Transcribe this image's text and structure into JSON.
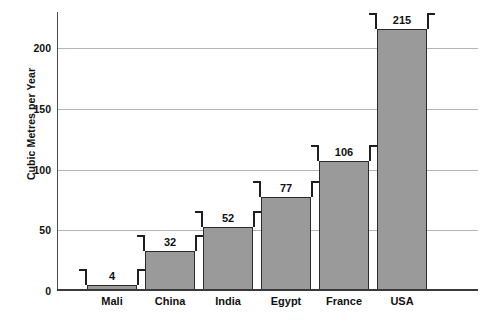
{
  "chart_data": {
    "type": "bar",
    "title": "",
    "xlabel": "",
    "ylabel": "Cubic Metres per Year",
    "categories": [
      "Mali",
      "China",
      "India",
      "Egypt",
      "France",
      "USA"
    ],
    "values": [
      4,
      32,
      52,
      77,
      106,
      215
    ],
    "value_labels": [
      "4",
      "32",
      "52",
      "77",
      "106",
      "215"
    ],
    "ylim": [
      0,
      230
    ],
    "yticks": [
      0,
      50,
      100,
      150,
      200
    ],
    "ytick_labels": [
      "0",
      "50",
      "100",
      "150",
      "200"
    ],
    "grid": true,
    "legend": "none",
    "series": [
      {
        "name": "Water use per person",
        "values": [
          4,
          32,
          52,
          77,
          106,
          215
        ]
      }
    ],
    "annotations": [
      "Each bar is topped by a measurement bracket with the value printed between the bracket arms."
    ]
  },
  "style": {
    "bar_fill": "#9a9a9a",
    "bar_border": "#2b2b2b",
    "gridline_color": "#b4b4b4",
    "axis_color": "#3a3a3a",
    "text_color": "#111111",
    "background": "#ffffff"
  },
  "title_sliver": {
    "text": ""
  }
}
